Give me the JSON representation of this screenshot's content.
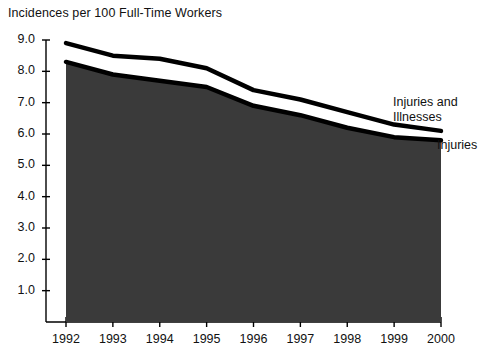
{
  "chart_data": {
    "type": "area",
    "title": "Incidences per 100 Full-Time Workers",
    "xlabel": "",
    "ylabel": "",
    "x": [
      1992,
      1993,
      1994,
      1995,
      1996,
      1997,
      1998,
      1999,
      2000
    ],
    "categories": [
      "1992",
      "1993",
      "1994",
      "1995",
      "1996",
      "1997",
      "1998",
      "1999",
      "2000"
    ],
    "series": [
      {
        "name": "Injuries and Illnesses",
        "values": [
          8.9,
          8.5,
          8.4,
          8.1,
          7.4,
          7.1,
          6.7,
          6.3,
          6.1
        ],
        "style": "line-upper",
        "color": "#000000"
      },
      {
        "name": "Injuries",
        "values": [
          8.3,
          7.9,
          7.7,
          7.5,
          6.9,
          6.6,
          6.2,
          5.9,
          5.8
        ],
        "style": "area-filled",
        "color": "#3a3a3a"
      }
    ],
    "ylim": [
      0,
      9.3
    ],
    "yticks": [
      1.0,
      2.0,
      3.0,
      4.0,
      5.0,
      6.0,
      7.0,
      8.0,
      9.0
    ],
    "ytick_labels": [
      "1.0",
      "2.0",
      "3.0",
      "4.0",
      "5.0",
      "6.0",
      "7.0",
      "8.0",
      "9.0"
    ],
    "xlim": [
      1992,
      2000
    ],
    "grid": false,
    "legend_position": "inline-right",
    "fill_color": "#3a3a3a",
    "line_color": "#000000",
    "background": "#ffffff"
  },
  "labels": {
    "series_upper": "Injuries and\nIllnesses",
    "series_upper_line1": "Injuries and",
    "series_upper_line2": "Illnesses",
    "series_lower": "Injuries"
  }
}
